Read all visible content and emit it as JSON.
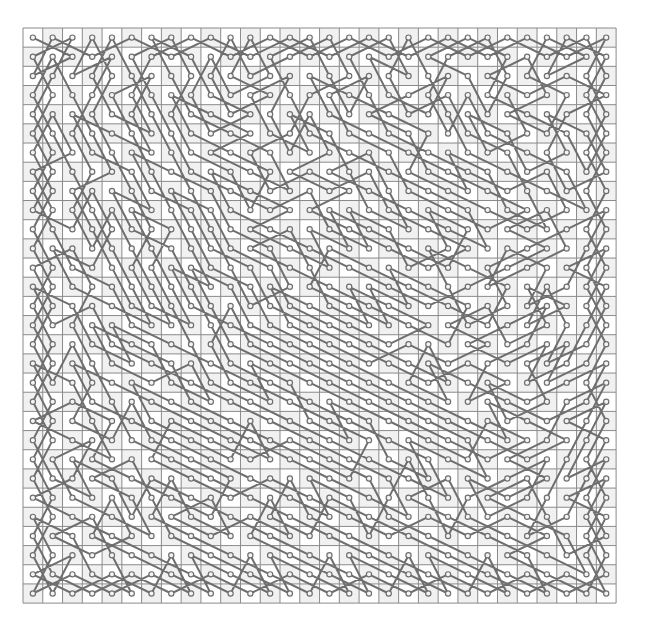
{
  "diagram": {
    "type": "knights-tour",
    "rows": 30,
    "cols": 30,
    "origin": {
      "x": 23,
      "y": 28
    },
    "cell_width": 19.77,
    "cell_height": 19.17,
    "start": {
      "row": 0,
      "col": 0
    },
    "move_set": [
      [
        1,
        2
      ],
      [
        2,
        1
      ],
      [
        2,
        -1
      ],
      [
        1,
        -2
      ],
      [
        -1,
        -2
      ],
      [
        -2,
        -1
      ],
      [
        -2,
        1
      ],
      [
        -1,
        2
      ]
    ],
    "node_radius": 2.6
  },
  "colors": {
    "background": "#ffffff",
    "cell_light": "#ffffff",
    "cell_dark": "#f1f1f1",
    "grid_line": "#8a8a8a",
    "path": "#6f6f6f",
    "node_stroke": "#6f6f6f",
    "node_fill": "#f4f4f4"
  }
}
